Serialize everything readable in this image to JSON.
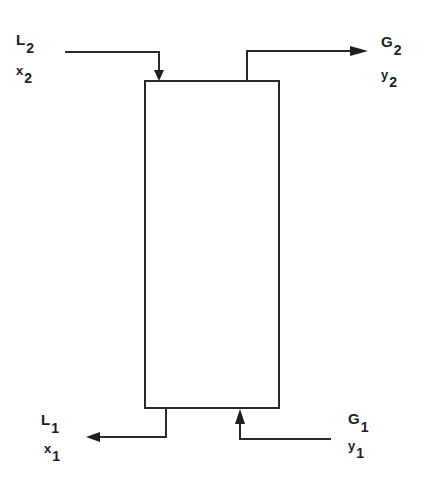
{
  "diagram": {
    "type": "countercurrent column flow schematic",
    "column": {
      "x": 145,
      "y": 81,
      "width": 134,
      "height": 327
    },
    "streams": {
      "liquid_in": {
        "symbol": "L",
        "subscript": "2",
        "composition_symbol": "x",
        "composition_subscript": "2",
        "direction": "into top of column"
      },
      "gas_out": {
        "symbol": "G",
        "subscript": "2",
        "composition_symbol": "y",
        "composition_subscript": "2",
        "direction": "out of top of column"
      },
      "liquid_out": {
        "symbol": "L",
        "subscript": "1",
        "composition_symbol": "x",
        "composition_subscript": "1",
        "direction": "out of bottom of column"
      },
      "gas_in": {
        "symbol": "G",
        "subscript": "1",
        "composition_symbol": "y",
        "composition_subscript": "1",
        "direction": "into bottom of column"
      }
    },
    "colors": {
      "line": "#2a2a2a",
      "background": "#ffffff",
      "text": "#222222"
    }
  }
}
